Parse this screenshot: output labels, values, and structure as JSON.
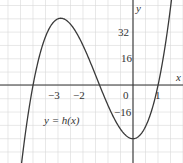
{
  "chart_data": {
    "type": "line",
    "title": "",
    "xlabel": "x",
    "ylabel": "y",
    "function_label": "y = h(x)",
    "expression": "h(x) = 6x^3 + 26x^2 - 32",
    "coefficients": {
      "a": 6,
      "b": 26,
      "c": 0,
      "d": -32
    },
    "x_ticks": [
      {
        "value": -3,
        "label": "−3"
      },
      {
        "value": -2,
        "label": "−2"
      },
      {
        "value": 0,
        "label": "0"
      },
      {
        "value": 1,
        "label": "1"
      }
    ],
    "y_ticks": [
      {
        "value": 32,
        "label": "32"
      },
      {
        "value": 16,
        "label": "16"
      },
      {
        "value": -16,
        "label": "−16"
      }
    ],
    "xlim": [
      -5.32,
      2.0
    ],
    "ylim": [
      -46.6,
      51.3
    ],
    "grid": true,
    "key_points": {
      "roots": [
        -4,
        -1.333,
        1
      ],
      "local_max": {
        "x": -2.89,
        "y": 40.4
      },
      "local_min": {
        "x": 0,
        "y": -32
      }
    },
    "series": [
      {
        "name": "y = h(x)",
        "x": [
          -5.0,
          -4.5,
          -4.0,
          -3.5,
          -3.0,
          -2.5,
          -2.0,
          -1.5,
          -1.0,
          -0.5,
          0.0,
          0.5,
          1.0,
          1.5
        ],
        "values": [
          -132,
          -65.8,
          0,
          30.3,
          40,
          36.75,
          24,
          8.25,
          -12,
          -26.25,
          -32,
          -24.75,
          0,
          46.75
        ]
      }
    ],
    "colors": {
      "curve": "#3a3a3a",
      "axis": "#333333",
      "grid": "#d9d9d9"
    }
  }
}
